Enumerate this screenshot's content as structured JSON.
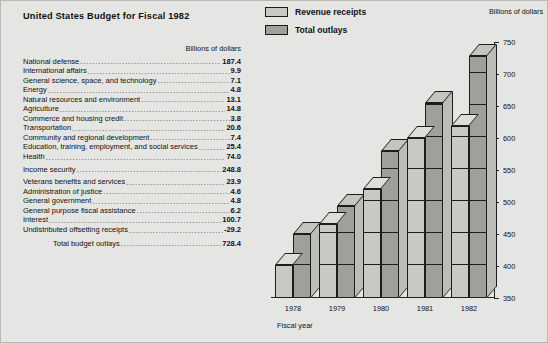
{
  "title": "United States Budget for Fiscal 1982",
  "units_label": "Billions of dollars",
  "table": {
    "units_header": "Billions of dollars",
    "rows": [
      {
        "label": "National defense",
        "value": "187.4",
        "gap": false
      },
      {
        "label": "International affairs",
        "value": "9.9",
        "gap": false
      },
      {
        "label": "General science, space, and technology",
        "value": "7.1",
        "gap": false
      },
      {
        "label": "Energy",
        "value": "4.8",
        "gap": false
      },
      {
        "label": "Natural resources and environment",
        "value": "13.1",
        "gap": false
      },
      {
        "label": "Agriculture",
        "value": "14.8",
        "gap": false
      },
      {
        "label": "Commerce and housing credit",
        "value": "3.8",
        "gap": false
      },
      {
        "label": "Transportation",
        "value": "20.6",
        "gap": false
      },
      {
        "label": "Community and regional development",
        "value": "7.4",
        "gap": false
      },
      {
        "label": "Education, training, employment, and social services",
        "value": "25.4",
        "gap": false
      },
      {
        "label": "Health",
        "value": "74.0",
        "gap": false
      },
      {
        "label": "Income security",
        "value": "248.8",
        "gap": true
      },
      {
        "label": "Veterans benefits and services",
        "value": "23.9",
        "gap": true
      },
      {
        "label": "Administration of justice",
        "value": "4.6",
        "gap": false
      },
      {
        "label": "General government",
        "value": "4.8",
        "gap": false
      },
      {
        "label": "General purpose fiscal assistance",
        "value": "6.2",
        "gap": false
      },
      {
        "label": "Interest",
        "value": "100.7",
        "gap": false
      },
      {
        "label": "Undistributed offsetting receipts",
        "value": "-29.2",
        "gap": false
      }
    ],
    "total": {
      "label": "Total budget outlays",
      "value": "728.4"
    }
  },
  "legend": [
    {
      "label": "Revenue receipts",
      "color": "#c9c9c4"
    },
    {
      "label": "Total outlays",
      "color": "#a0a09a"
    }
  ],
  "chart_data": {
    "type": "bar",
    "title": "United States Budget for Fiscal 1982",
    "xlabel": "Fiscal year",
    "ylabel": "Billions of dollars",
    "categories": [
      "1978",
      "1979",
      "1980",
      "1981",
      "1982"
    ],
    "series": [
      {
        "name": "Revenue receipts",
        "color": "#c9c9c4",
        "values": [
          402,
          466,
          520,
          600,
          618
        ]
      },
      {
        "name": "Total outlays",
        "color": "#a0a09a",
        "values": [
          450,
          493,
          580,
          655,
          728
        ]
      }
    ],
    "ylim": [
      350,
      750
    ],
    "yticks": [
      350,
      400,
      450,
      500,
      550,
      600,
      650,
      700,
      750
    ],
    "grid": false,
    "legend_position": "top"
  }
}
